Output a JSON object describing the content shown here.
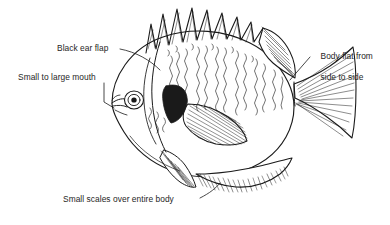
{
  "figure": {
    "background_color": "#ffffff",
    "ink_color": "#1a1a1a",
    "text_color": "#262626",
    "width": 390,
    "height": 225
  },
  "labels": {
    "ear_flap": "Black ear flap",
    "mouth": "Small to large mouth",
    "body_flat_line1": "Body flat from",
    "body_flat_line2": "side to side",
    "scales": "Small scales over entire body"
  },
  "parts": {
    "spiny_dorsal_fin": "spiny-dorsal-fin",
    "soft_dorsal_fin": "soft-dorsal-fin",
    "caudal_fin": "caudal-fin",
    "anal_fin": "anal-fin",
    "pelvic_fin": "pelvic-fin",
    "pectoral_fin": "pectoral-fin",
    "eye": "eye",
    "mouth": "mouth",
    "opercular_flap": "black-ear-flap",
    "gill_cover": "gill-cover",
    "body_scales": "scale-texture",
    "vertical_bars": "vertical-bar-markings"
  },
  "leaders": {
    "ear_flap_leader": "leader-line-ear-flap",
    "mouth_leader": "leader-line-mouth",
    "body_flat_leader": "leader-line-body-flat",
    "scales_leader": "leader-line-scales"
  },
  "counts": {
    "dorsal_spines": 9
  }
}
